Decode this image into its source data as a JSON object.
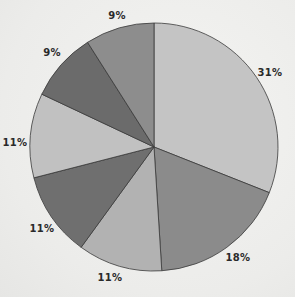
{
  "chart_data": {
    "type": "pie",
    "title": "",
    "start_angle_deg": 0,
    "direction": "clockwise",
    "center": [
      154,
      147
    ],
    "radius": 124,
    "slices": [
      {
        "label": "31%",
        "value": 31,
        "color": "#c4c4c4",
        "label_pos": [
          270,
          76
        ]
      },
      {
        "label": "18%",
        "value": 18,
        "color": "#8b8b8b",
        "label_pos": [
          238,
          261
        ]
      },
      {
        "label": "11%",
        "value": 11,
        "color": "#b2b2b2",
        "label_pos": [
          110,
          281
        ]
      },
      {
        "label": "11%",
        "value": 11,
        "color": "#6f6f6f",
        "label_pos": [
          42,
          232
        ]
      },
      {
        "label": "11%",
        "value": 11,
        "color": "#c1c1c1",
        "label_pos": [
          15,
          146
        ]
      },
      {
        "label": "9%",
        "value": 9,
        "color": "#6b6b6b",
        "label_pos": [
          52,
          56
        ]
      },
      {
        "label": "9%",
        "value": 9,
        "color": "#8d8d8d",
        "label_pos": [
          117,
          19
        ]
      }
    ],
    "legend": null,
    "stroke_color": "#3a3a3a"
  }
}
